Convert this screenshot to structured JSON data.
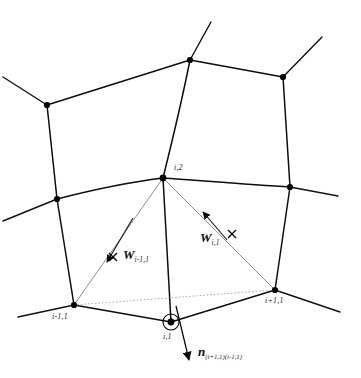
{
  "figure": {
    "kind": "mesh-diagram",
    "background_color": "#ffffff",
    "ink_color": "#0d0d0d",
    "dual_color": "#6a6a6a"
  },
  "node_labels": {
    "center_top": "i,2",
    "bottom_left": "i-1,1",
    "bottom_center": "i,1",
    "bottom_right": "i+1,1"
  },
  "vectors": {
    "w_left": {
      "symbol": "W",
      "subscript": "i-1,1",
      "overbar": "arrow"
    },
    "w_right": {
      "symbol": "W",
      "subscript": "i,1",
      "overbar": "arrow"
    },
    "normal": {
      "symbol": "n",
      "subscript": "(i+1,1)(i-1,1)",
      "overbar": "arrow"
    }
  },
  "markers": {
    "cross_left": "×",
    "cross_right": "×",
    "highlight_ring": "circle-marker"
  },
  "geometry": {
    "nodes": [
      {
        "name": "n-upper-left",
        "x": 47,
        "y": 105
      },
      {
        "name": "n-upper-mid",
        "x": 190,
        "y": 60
      },
      {
        "name": "n-upper-right",
        "x": 283,
        "y": 77
      },
      {
        "name": "n-mid-left",
        "x": 57,
        "y": 199
      },
      {
        "name": "n-center-i2",
        "x": 163,
        "y": 178
      },
      {
        "name": "n-mid-right",
        "x": 290,
        "y": 187
      },
      {
        "name": "n-bottom-left",
        "x": 74,
        "y": 305
      },
      {
        "name": "n-bottom-center",
        "x": 171,
        "y": 322
      },
      {
        "name": "n-bottom-right",
        "x": 275,
        "y": 290
      }
    ],
    "open_stubs": [
      {
        "name": "stub-upper-left",
        "x": 3,
        "y": 77
      },
      {
        "name": "stub-top-mid",
        "x": 211,
        "y": 22
      },
      {
        "name": "stub-top-right",
        "x": 322,
        "y": 37
      },
      {
        "name": "stub-mid-left",
        "x": 3,
        "y": 221
      },
      {
        "name": "stub-mid-right",
        "x": 338,
        "y": 196
      },
      {
        "name": "stub-bottom-left",
        "x": 18,
        "y": 317
      },
      {
        "name": "stub-bottom-right",
        "x": 340,
        "y": 312
      }
    ],
    "cross_left": {
      "x": 113,
      "y": 257
    },
    "cross_right": {
      "x": 232,
      "y": 234
    }
  }
}
